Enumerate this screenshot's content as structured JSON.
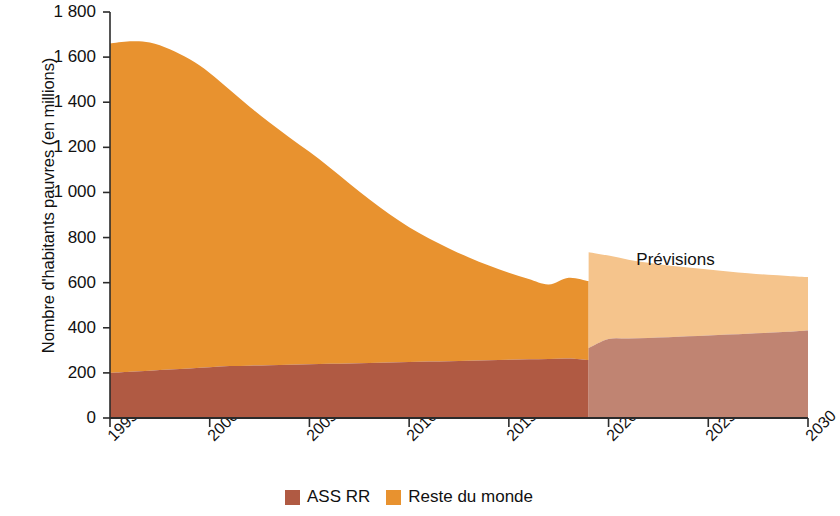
{
  "chart_data": {
    "type": "area",
    "stacked": true,
    "title": "",
    "subtitle": "",
    "xlabel": "",
    "ylabel": "Nombre d'habitants pauvres (en millions)",
    "xlim": [
      1995,
      2030
    ],
    "ylim": [
      0,
      1800
    ],
    "x_ticks": [
      1995,
      2000,
      2005,
      2010,
      2015,
      2020,
      2025,
      2030
    ],
    "x_tick_labels": [
      "1995",
      "2000",
      "2005",
      "2010",
      "2015",
      "2020",
      "2025",
      "2030"
    ],
    "y_ticks": [
      0,
      200,
      400,
      600,
      800,
      1000,
      1200,
      1400,
      1600,
      1800
    ],
    "y_tick_labels": [
      "0",
      "200",
      "400",
      "600",
      "800",
      "1 000",
      "1 200",
      "1 400",
      "1 600",
      "1 800"
    ],
    "grid": false,
    "legend_position": "bottom-center",
    "annotations": [
      {
        "text": "Prévisions",
        "x": 2024.0,
        "y": 700
      }
    ],
    "forecast_start_year": 2019,
    "x": [
      1995,
      1996,
      1997,
      1998,
      1999,
      2000,
      2001,
      2002,
      2003,
      2004,
      2005,
      2006,
      2007,
      2008,
      2009,
      2010,
      2011,
      2012,
      2013,
      2014,
      2015,
      2016,
      2017,
      2018,
      2019
    ],
    "series": [
      {
        "name": "ASS RR",
        "color": "#b05a43",
        "values": [
          200,
          205,
          210,
          215,
          220,
          225,
          230,
          232,
          234,
          236,
          238,
          240,
          242,
          244,
          246,
          248,
          250,
          252,
          254,
          256,
          258,
          260,
          262,
          264,
          257
        ]
      },
      {
        "name": "Reste du monde",
        "color": "#e8922f",
        "values": [
          1460,
          1465,
          1455,
          1420,
          1370,
          1305,
          1225,
          1148,
          1076,
          1008,
          942,
          872,
          798,
          726,
          658,
          598,
          546,
          500,
          458,
          420,
          386,
          356,
          330,
          358,
          350
        ]
      }
    ],
    "forecast": {
      "x": [
        2019,
        2020,
        2021,
        2022,
        2023,
        2024,
        2025,
        2026,
        2027,
        2028,
        2029,
        2030
      ],
      "series": [
        {
          "name": "ASS RR",
          "color": "#c08472",
          "values": [
            310,
            350,
            352,
            355,
            358,
            362,
            366,
            370,
            374,
            378,
            382,
            388
          ]
        },
        {
          "name": "Reste du monde",
          "color": "#f5c48c",
          "values": [
            425,
            370,
            350,
            333,
            318,
            305,
            292,
            280,
            268,
            257,
            248,
            237
          ]
        }
      ]
    },
    "totals_note": {
      "historical_total_1995": 1660,
      "historical_total_2019": 607,
      "forecast_total_2019": 735,
      "forecast_total_2030": 625
    }
  },
  "legend": {
    "entries": [
      {
        "label": "ASS RR",
        "color": "#b05a43"
      },
      {
        "label": "Reste du monde",
        "color": "#e8922f"
      }
    ]
  },
  "colors": {
    "accent_orange": "#e8922f",
    "accent_brown": "#b05a43",
    "forecast_orange": "#f5c48c",
    "forecast_brown": "#c08472",
    "axis": "#2b2b2b",
    "background": "#ffffff"
  }
}
